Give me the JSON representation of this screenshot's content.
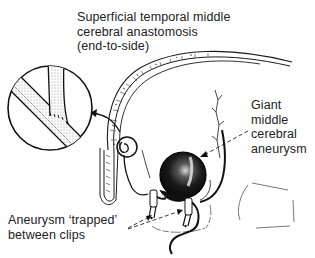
{
  "diagram": {
    "labels": {
      "anastomosis": {
        "lines": [
          "Superficial temporal middle",
          "cerebral anastomosis",
          "(end-to-side)"
        ]
      },
      "giant_aneurysm": {
        "lines": [
          "Giant",
          "middle",
          "cerebral",
          "aneurysm"
        ]
      },
      "trapped": {
        "lines": [
          "Aneurysm ‘trapped’",
          "between clips"
        ]
      }
    },
    "elements": {
      "inset_magnifier": "magnified-anastomosis-inset",
      "skull": "skull-cross-section",
      "aneurysm": "giant-aneurysm-sphere",
      "clips": [
        "proximal-clip",
        "distal-clip"
      ],
      "artery": "superficial-temporal-artery"
    },
    "colors": {
      "ink": "#1a1a1a",
      "background": "#ffffff",
      "shading": "#9a9a9a"
    }
  }
}
